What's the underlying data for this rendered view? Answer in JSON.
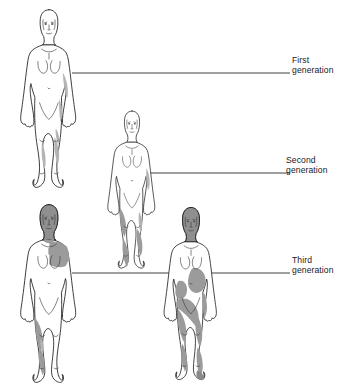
{
  "diagram": {
    "background_color": "#ffffff",
    "outline_color": "#1a1a1a",
    "shade_light_color": "#b4b4b4",
    "shade_mid_color": "#9b9b9b",
    "shade_dark_color": "#8a8a8a",
    "leader_line_color": "#2b2b2b"
  },
  "labels": [
    {
      "id": "first",
      "ordinal": "First",
      "generation_word": "generation",
      "full_text": "First generation",
      "leader_line": {
        "x1": 72,
        "y1": 73,
        "x2": 290,
        "y2": 73
      }
    },
    {
      "id": "second",
      "ordinal": "Second",
      "generation_word": "generation",
      "full_text": "Second generation",
      "leader_line": {
        "x1": 148,
        "y1": 173,
        "x2": 290,
        "y2": 173
      }
    },
    {
      "id": "third",
      "ordinal": "Third",
      "generation_word": "generation",
      "full_text": "Third generation",
      "leader_line": {
        "x1": 72,
        "y1": 273,
        "x2": 290,
        "y2": 273
      }
    }
  ],
  "figures": [
    {
      "id": "figure-1",
      "generation": "First",
      "position": "top-left",
      "head_shaded": false,
      "shading_level": "minimal",
      "shaded_regions": [
        "right-flank",
        "right-hip",
        "left-lower-leg",
        "right-lower-leg",
        "right-knee"
      ]
    },
    {
      "id": "figure-2",
      "generation": "Second",
      "position": "middle",
      "head_shaded": false,
      "shading_level": "moderate",
      "shaded_regions": [
        "right-upper-arm",
        "left-thigh",
        "left-lower-leg",
        "right-lower-leg",
        "right-knee"
      ]
    },
    {
      "id": "figure-3",
      "generation": "Third",
      "position": "bottom-left",
      "head_shaded": true,
      "shading_level": "extensive",
      "shaded_regions": [
        "head",
        "neck",
        "right-shoulder",
        "right-chest",
        "left-thigh",
        "left-lower-leg"
      ]
    },
    {
      "id": "figure-4",
      "generation": "Third",
      "position": "bottom-right",
      "head_shaded": true,
      "shading_level": "most-extensive",
      "shaded_regions": [
        "head",
        "right-abdomen",
        "left-abdomen",
        "left-hip",
        "right-hip",
        "left-thigh",
        "right-thigh",
        "left-lower-leg",
        "right-lower-leg",
        "right-foot"
      ]
    }
  ]
}
